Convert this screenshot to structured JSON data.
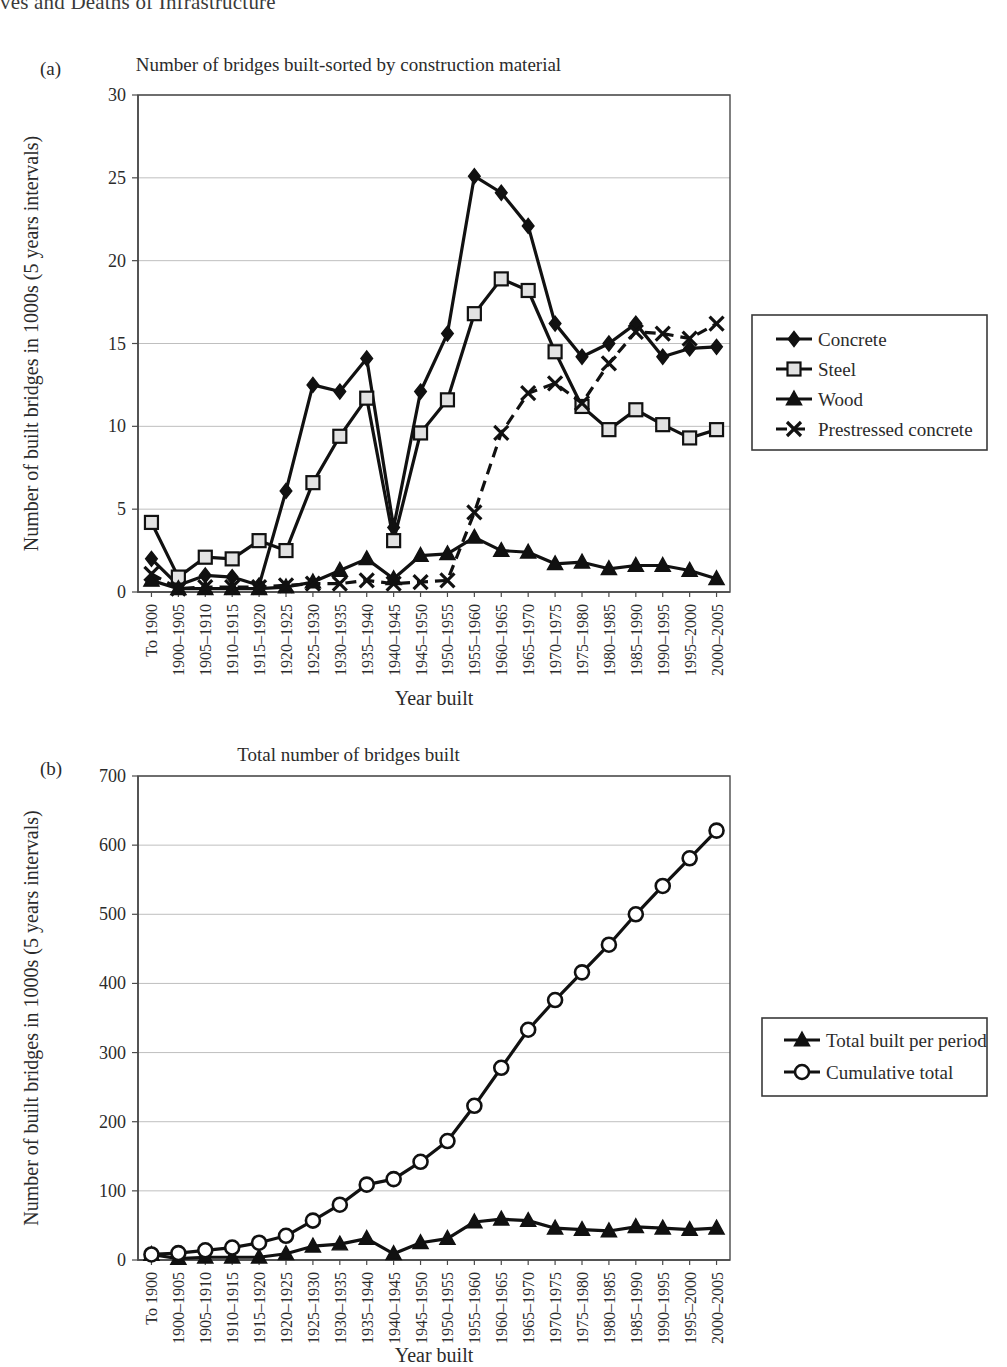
{
  "page_header": "ves and Deaths of Infrastructure",
  "panels": [
    {
      "label": "(a)",
      "title": "Number of bridges built-sorted by construction material",
      "y_axis_title": "Number of built bridges in 1000s (5 years intervals)",
      "x_axis_title": "Year built"
    },
    {
      "label": "(b)",
      "title": "Total number of bridges built",
      "y_axis_title": "Number of built bridges in 1000s (5 years intervals)",
      "x_axis_title": "Year built"
    }
  ],
  "chart_data": [
    {
      "type": "line",
      "title": "Number of bridges built-sorted by construction material",
      "xlabel": "Year built",
      "ylabel": "Number of built bridges in 1000s (5 years intervals)",
      "ylim": [
        0,
        30
      ],
      "yticks": [
        0,
        5,
        10,
        15,
        20,
        25,
        30
      ],
      "grid": true,
      "legend_position": "right",
      "categories": [
        "To 1900",
        "1900–1905",
        "1905–1910",
        "1910–1915",
        "1915–1920",
        "1920–1925",
        "1925–1930",
        "1930–1935",
        "1935–1940",
        "1940–1945",
        "1945–1950",
        "1950–1955",
        "1955–1960",
        "1960–1965",
        "1965–1970",
        "1970–1975",
        "1975–1980",
        "1980–1985",
        "1985–1990",
        "1990–1995",
        "1995–2000",
        "2000–2005"
      ],
      "series": [
        {
          "name": "Concrete",
          "marker": "diamond",
          "dashed": false,
          "values": [
            2.0,
            0.4,
            1.0,
            0.9,
            0.4,
            6.1,
            12.5,
            12.1,
            14.1,
            3.9,
            12.1,
            15.6,
            25.1,
            24.1,
            22.1,
            16.2,
            14.2,
            15.0,
            16.2,
            14.2,
            14.7,
            14.8
          ]
        },
        {
          "name": "Steel",
          "marker": "square",
          "dashed": false,
          "values": [
            4.2,
            0.9,
            2.1,
            2.0,
            3.1,
            2.5,
            6.6,
            9.4,
            11.7,
            3.1,
            9.6,
            11.6,
            16.8,
            18.9,
            18.2,
            14.5,
            11.2,
            9.8,
            11.0,
            10.1,
            9.3,
            9.8
          ]
        },
        {
          "name": "Wood",
          "marker": "triangle",
          "dashed": false,
          "values": [
            0.7,
            0.2,
            0.2,
            0.2,
            0.2,
            0.3,
            0.6,
            1.3,
            2.0,
            0.8,
            2.2,
            2.3,
            3.3,
            2.5,
            2.4,
            1.7,
            1.8,
            1.4,
            1.6,
            1.6,
            1.3,
            0.8
          ]
        },
        {
          "name": "Prestressed concrete",
          "marker": "x",
          "dashed": true,
          "values": [
            1.1,
            0.2,
            0.3,
            0.3,
            0.3,
            0.4,
            0.5,
            0.5,
            0.7,
            0.5,
            0.6,
            0.7,
            4.8,
            9.6,
            12.0,
            12.6,
            11.4,
            13.8,
            15.7,
            15.6,
            15.3,
            16.2
          ]
        }
      ]
    },
    {
      "type": "line",
      "title": "Total number of bridges built",
      "xlabel": "Year built",
      "ylabel": "Number of built bridges in 1000s (5 years intervals)",
      "ylim": [
        0,
        700
      ],
      "yticks": [
        0,
        100,
        200,
        300,
        400,
        500,
        600,
        700
      ],
      "grid": true,
      "legend_position": "right",
      "categories": [
        "To 1900",
        "1900–1905",
        "1905–1910",
        "1910–1915",
        "1915–1920",
        "1920–1925",
        "1925–1930",
        "1930–1935",
        "1935–1940",
        "1940–1945",
        "1945–1950",
        "1950–1955",
        "1955–1960",
        "1960–1965",
        "1965–1970",
        "1970–1975",
        "1975–1980",
        "1980–1985",
        "1985–1990",
        "1990–1995",
        "1995–2000",
        "2000–2005"
      ],
      "series": [
        {
          "name": "Total built per period",
          "marker": "triangle",
          "dashed": false,
          "values": [
            8,
            2,
            4,
            4,
            4,
            9,
            20,
            23,
            31,
            9,
            25,
            31,
            55,
            59,
            57,
            46,
            44,
            42,
            48,
            46,
            44,
            46
          ]
        },
        {
          "name": "Cumulative total",
          "marker": "circle",
          "dashed": false,
          "values": [
            8,
            10,
            14,
            18,
            25,
            35,
            57,
            80,
            109,
            117,
            142,
            172,
            223,
            278,
            333,
            376,
            416,
            456,
            500,
            541,
            581,
            621
          ]
        }
      ]
    }
  ]
}
